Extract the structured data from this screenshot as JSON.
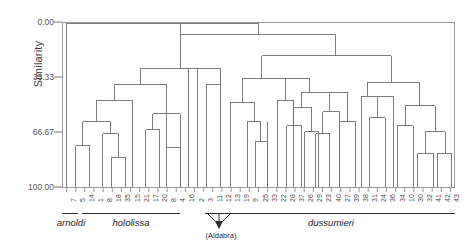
{
  "figure": {
    "type": "dendrogram",
    "y_axis_title": "Similarity",
    "y_ticks": [
      "0.00",
      "33.33",
      "66.67",
      "100.00"
    ],
    "annotation": "(Aldabra)"
  },
  "groups": [
    {
      "name": "arnoldi",
      "first_leaf": 0,
      "last_leaf": 0
    },
    {
      "name": "hololissa",
      "first_leaf": 1,
      "last_leaf": 13
    },
    {
      "name": "dussumieri",
      "first_leaf": 14,
      "last_leaf": 42
    }
  ],
  "chart_data": {
    "type": "dendrogram",
    "title": "",
    "xlabel": "",
    "ylabel": "Similarity",
    "ylim": [
      0,
      100
    ],
    "y_inverted": true,
    "y_ticks": [
      0.0,
      33.33,
      66.67,
      100.0
    ],
    "y_tick_labels": [
      "0.00",
      "33.33",
      "66.67",
      "100.00"
    ],
    "grid": false,
    "legend": "none",
    "leaf_labels": [
      "7",
      "5",
      "14",
      "1",
      "8",
      "18",
      "35",
      "15",
      "21",
      "17",
      "20",
      "8",
      "4",
      "16",
      "2",
      "3",
      "11",
      "12",
      "13",
      "19",
      "9",
      "25",
      "33",
      "22",
      "28",
      "37",
      "26",
      "29",
      "23",
      "40",
      "27",
      "39",
      "38",
      "31",
      "24",
      "36",
      "34",
      "10",
      "30",
      "32",
      "41",
      "42",
      "43"
    ],
    "leaf_count": 43,
    "aldabra_leaves": [
      "11",
      "12",
      "13"
    ],
    "group_brackets": [
      {
        "label": "arnoldi",
        "leaves": [
          "7"
        ]
      },
      {
        "label": "hololissa",
        "leaves": [
          "5",
          "14",
          "1",
          "8",
          "18",
          "35",
          "15",
          "21",
          "17",
          "20",
          "8",
          "4",
          "16"
        ]
      },
      {
        "label": "dussumieri",
        "leaves": [
          "2",
          "3",
          "11",
          "12",
          "13",
          "19",
          "9",
          "25",
          "33",
          "22",
          "28",
          "37",
          "26",
          "29",
          "23",
          "40",
          "27",
          "39",
          "38",
          "31",
          "24",
          "36",
          "34",
          "10",
          "30",
          "32",
          "41",
          "42",
          "43"
        ]
      }
    ],
    "merges": [
      {
        "left": [
          0
        ],
        "right": "rest",
        "similarity": 0.0
      },
      {
        "note": "successive nested merges at increasing similarity down to 100.00"
      }
    ]
  }
}
